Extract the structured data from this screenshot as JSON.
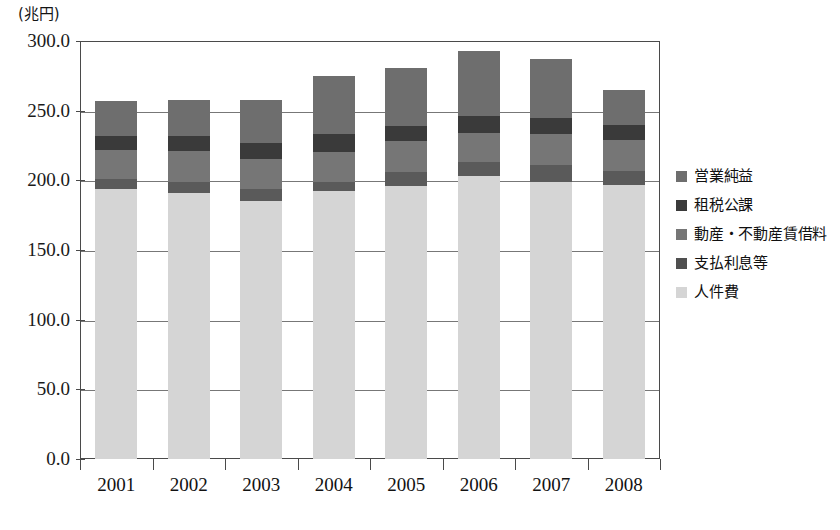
{
  "chart_data": {
    "type": "bar",
    "subtype": "stacked-column",
    "title": "",
    "unit_label": "(兆円)",
    "xlabel": "",
    "ylabel": "",
    "categories": [
      "2001",
      "2002",
      "2003",
      "2004",
      "2005",
      "2006",
      "2007",
      "2008"
    ],
    "ylim": [
      0.0,
      300.0
    ],
    "ytick_labels": [
      "0.0",
      "50.0",
      "100.0",
      "150.0",
      "200.0",
      "250.0",
      "300.0"
    ],
    "ytick_values": [
      0.0,
      50.0,
      100.0,
      150.0,
      200.0,
      250.0,
      300.0
    ],
    "grid": true,
    "legend_position": "right",
    "stack_order_bottom_to_top": [
      "人件費",
      "支払利息等",
      "動産・不動産賃借料",
      "租税公課",
      "営業純益"
    ],
    "series": [
      {
        "name": "人件費",
        "color": "#d5d5d5",
        "values": [
          194.0,
          191.0,
          185.0,
          192.0,
          196.0,
          203.0,
          199.0,
          197.0
        ]
      },
      {
        "name": "支払利息等",
        "color": "#5a5a5a",
        "values": [
          7.0,
          8.0,
          9.0,
          7.0,
          10.0,
          10.0,
          12.0,
          10.0
        ]
      },
      {
        "name": "動産・不動産賃借料",
        "color": "#767676",
        "values": [
          21.0,
          22.0,
          21.0,
          21.0,
          22.0,
          21.0,
          22.0,
          22.0
        ]
      },
      {
        "name": "租税公課",
        "color": "#3a3a3a",
        "values": [
          10.0,
          11.0,
          12.0,
          13.0,
          11.0,
          12.0,
          12.0,
          11.0
        ]
      },
      {
        "name": "営業純益",
        "color": "#6e6e6e",
        "values": [
          25.0,
          26.0,
          31.0,
          42.0,
          42.0,
          47.0,
          42.0,
          25.0
        ]
      }
    ],
    "totals": [
      257.0,
      258.0,
      258.0,
      275.0,
      281.0,
      293.0,
      287.0,
      265.0
    ]
  },
  "legend": {
    "items": [
      {
        "label": "営業純益",
        "color": "#6e6e6e"
      },
      {
        "label": "租税公課",
        "color": "#3a3a3a"
      },
      {
        "label": "動産・不動産賃借料",
        "color": "#767676"
      },
      {
        "label": "支払利息等",
        "color": "#4f4f4f"
      },
      {
        "label": "人件費",
        "color": "#d5d5d5"
      }
    ]
  },
  "axis": {
    "unit": "(兆円)"
  }
}
